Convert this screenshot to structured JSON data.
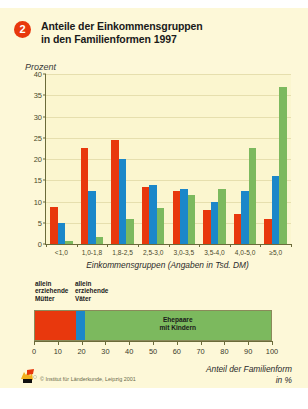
{
  "figure": {
    "badge_number": "2",
    "title": "Anteile der Einkommensgruppen\nin den Familienformen 1997",
    "title_line1": "Anteile der Einkommensgruppen",
    "title_line2": "in den Familienformen 1997",
    "background": "#fdf8d8"
  },
  "colors": {
    "red": "#e8380d",
    "blue": "#1b87c9",
    "green": "#7cb95e",
    "plot_bg": "#fbf6cf",
    "axis": "#6b6b3a",
    "grid": "#e6dfae"
  },
  "legend": {
    "muetter_line1": "allein",
    "muetter_line2": "erziehende",
    "muetter_line3": "Mütter",
    "vaeter_line1": "allein",
    "vaeter_line2": "erziehende",
    "vaeter_line3": "Väter",
    "ehepaare_line1": "Ehepaare",
    "ehepaare_line2": "mit Kindern"
  },
  "footer": {
    "axis_title_line1": "Anteil der Familienform",
    "axis_title_line2": "in %",
    "credit": "© Institut für Länderkunde, Leipzig 2001"
  },
  "chart_data": {
    "type": "bar",
    "title": "Anteile der Einkommensgruppen in den Familienformen 1997",
    "xlabel": "Einkommensgruppen (Angaben in Tsd. DM)",
    "ylabel": "Prozent",
    "ylim": [
      0,
      40
    ],
    "yticks": [
      0,
      5,
      10,
      15,
      20,
      25,
      30,
      35,
      40
    ],
    "grid": true,
    "legend_position": "below",
    "categories": [
      "<1,0",
      "1,0-1,8",
      "1,8-2,5",
      "2,5-3,0",
      "3,0-3,5",
      "3,5-4,0",
      "4,0-5,0",
      "≥5,0"
    ],
    "series": [
      {
        "name": "allein erziehende Mütter",
        "color": "#e8380d",
        "values": [
          8.7,
          22.5,
          24.5,
          13.5,
          12.5,
          8.0,
          7.0,
          6.0
        ]
      },
      {
        "name": "allein erziehende Väter",
        "color": "#1b87c9",
        "values": [
          5.0,
          12.5,
          20.0,
          14.0,
          13.0,
          10.0,
          12.5,
          16.0
        ]
      },
      {
        "name": "Ehepaare mit Kindern",
        "color": "#7cb95e",
        "values": [
          0.6,
          1.6,
          6.0,
          8.5,
          11.5,
          13.0,
          22.5,
          37.0
        ]
      }
    ]
  },
  "stacked_bar": {
    "type": "bar",
    "orientation": "horizontal",
    "xlabel": "Anteil der Familienform in %",
    "xlim": [
      0,
      100
    ],
    "xticks": [
      0,
      10,
      20,
      30,
      40,
      50,
      60,
      70,
      80,
      90,
      100
    ],
    "segments": [
      {
        "name": "allein erziehende Mütter",
        "color": "#e8380d",
        "value": 17.5
      },
      {
        "name": "allein erziehende Väter",
        "color": "#1b87c9",
        "value": 3.5
      },
      {
        "name": "Ehepaare mit Kindern",
        "color": "#7cb95e",
        "value": 79.0
      }
    ]
  }
}
